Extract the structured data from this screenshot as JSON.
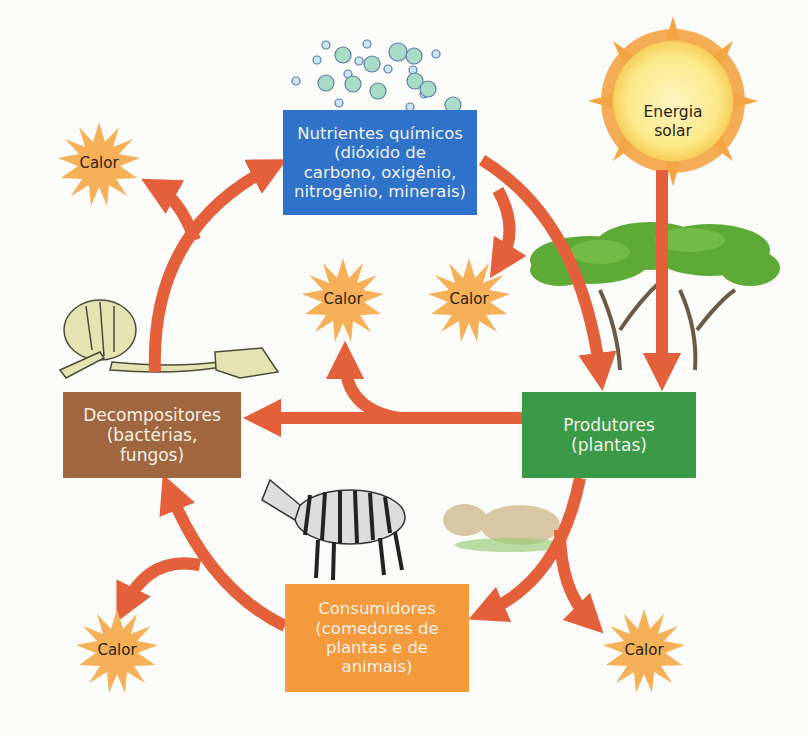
{
  "diagram": {
    "type": "nutrient-cycle / energy-flow ecosystem diagram",
    "colors": {
      "arrow": "#e4603a",
      "nutrients_box": "#2f72c9",
      "producers_box": "#3a9a48",
      "decomposers_box": "#a0663f",
      "consumers_box": "#f39a3c",
      "heat_burst": "#f6b057",
      "sun_core": "#fbe98a",
      "sun_rays": "#f3a443"
    },
    "nodes": {
      "sun": {
        "line1": "Energia",
        "line2": "solar"
      },
      "nutrients": {
        "line1": "Nutrientes químicos",
        "line2": "(dióxido de",
        "line3": "carbono, oxigênio,",
        "line4": "nitrogênio, minerais)"
      },
      "producers": {
        "line1": "Produtores",
        "line2": "(plantas)"
      },
      "decomposers": {
        "line1": "Decompositores",
        "line2": "(bactérias,",
        "line3": "fungos)"
      },
      "consumers": {
        "line1": "Consumidores",
        "line2": "(comedores de",
        "line3": "plantas e de",
        "line4": "animais)"
      }
    },
    "heat": [
      {
        "label": "Calor",
        "position": "top-left"
      },
      {
        "label": "Calor",
        "position": "center-left"
      },
      {
        "label": "Calor",
        "position": "center-right"
      },
      {
        "label": "Calor",
        "position": "bottom-left"
      },
      {
        "label": "Calor",
        "position": "bottom-right"
      }
    ],
    "illustrations": [
      "molecules",
      "acacia-trees",
      "zebra",
      "lioness",
      "animal-skeleton"
    ],
    "flows": [
      {
        "from": "sun",
        "to": "producers"
      },
      {
        "from": "nutrients",
        "to": "producers"
      },
      {
        "from": "producers",
        "to": "decomposers"
      },
      {
        "from": "producers",
        "to": "heat"
      },
      {
        "from": "producers",
        "to": "consumers"
      },
      {
        "from": "consumers",
        "to": "heat"
      },
      {
        "from": "consumers",
        "to": "decomposers"
      },
      {
        "from": "decomposers",
        "to": "heat"
      },
      {
        "from": "decomposers",
        "to": "nutrients"
      }
    ]
  }
}
